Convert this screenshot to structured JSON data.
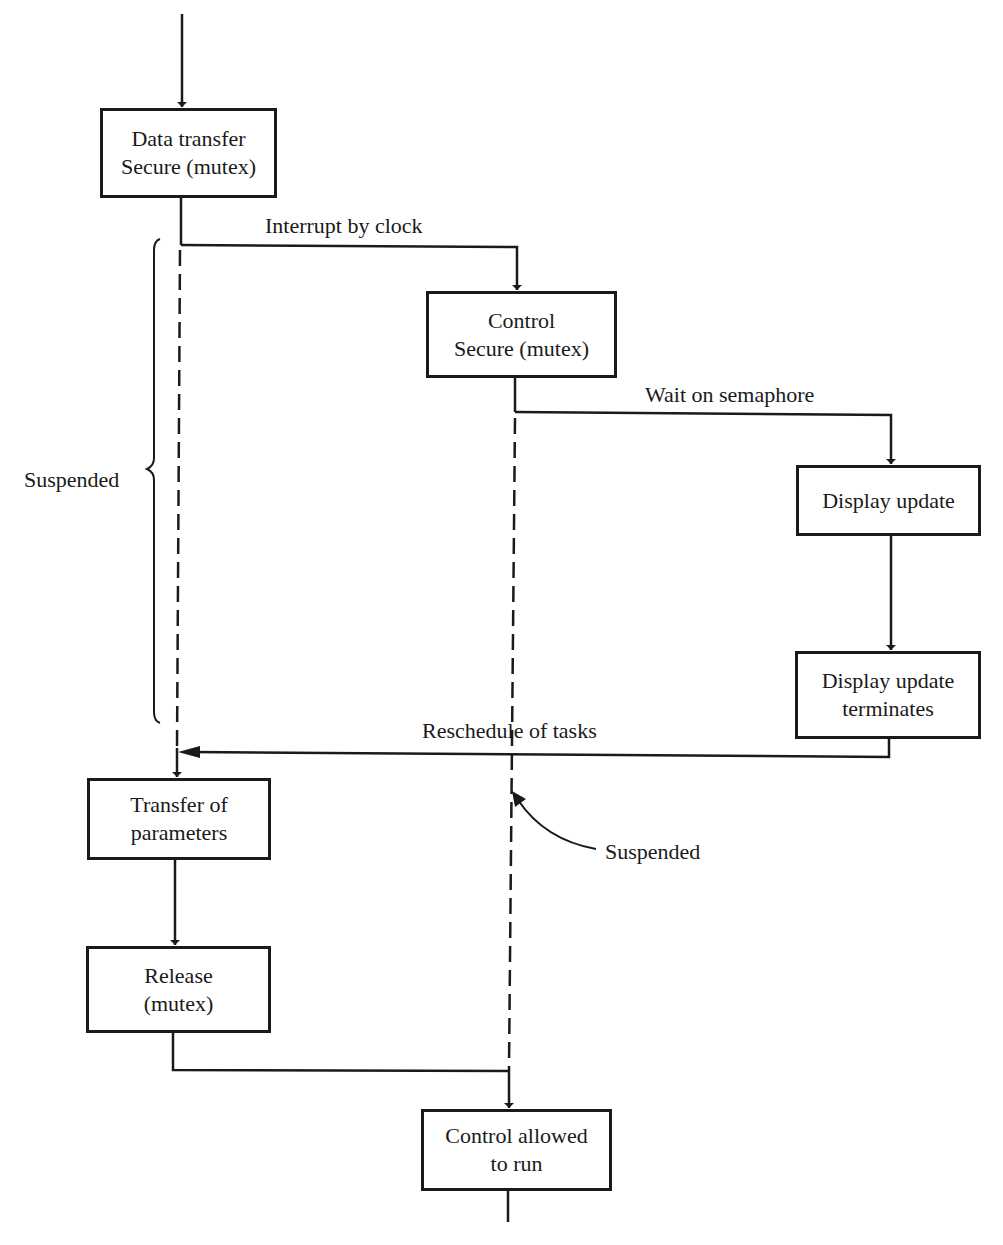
{
  "diagram": {
    "type": "task-scheduling-timing-diagram",
    "boxes": {
      "data_transfer": {
        "line1": "Data transfer",
        "line2": "Secure (mutex)"
      },
      "control": {
        "line1": "Control",
        "line2": "Secure (mutex)"
      },
      "display_update": {
        "line1": "Display update"
      },
      "display_update_terminates": {
        "line1": "Display update",
        "line2": "terminates"
      },
      "transfer_params": {
        "line1": "Transfer of",
        "line2": "parameters"
      },
      "release": {
        "line1": "Release",
        "line2": "(mutex)"
      },
      "control_allowed": {
        "line1": "Control allowed",
        "line2": "to run"
      }
    },
    "edge_labels": {
      "interrupt": "Interrupt by clock",
      "wait": "Wait on semaphore",
      "reschedule": "Reschedule of tasks"
    },
    "annotations": {
      "suspended_left": "Suspended",
      "suspended_right": "Suspended"
    },
    "colors": {
      "ink": "#1a1a1a",
      "background": "#ffffff"
    }
  }
}
